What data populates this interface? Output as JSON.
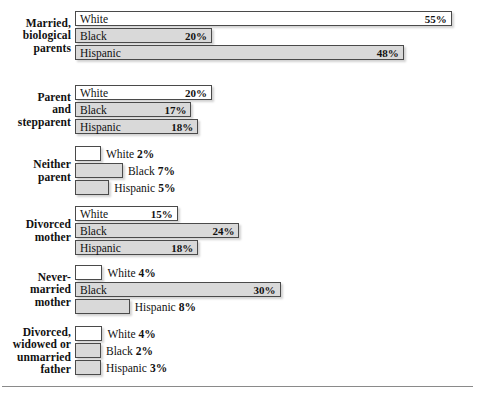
{
  "chart_data": {
    "type": "bar",
    "title": "",
    "subtitle": "",
    "xlabel": "",
    "ylabel": "",
    "orientation": "horizontal",
    "grid": false,
    "legend": "inline-series-labels",
    "value_unit": "%",
    "xlim": [
      0,
      55
    ],
    "series_names": [
      "White",
      "Black",
      "Hispanic"
    ],
    "categories": [
      "Married, biological parents",
      "Parent and stepparent",
      "Neither parent",
      "Divorced mother",
      "Never-married mother",
      "Divorced, widowed or unmarried father"
    ],
    "series": [
      {
        "name": "White",
        "values": [
          55,
          20,
          2,
          15,
          4,
          4
        ]
      },
      {
        "name": "Black",
        "values": [
          20,
          17,
          7,
          24,
          30,
          2
        ]
      },
      {
        "name": "Hispanic",
        "values": [
          48,
          18,
          5,
          18,
          8,
          3
        ]
      }
    ]
  },
  "colors": {
    "white_bar_fill": "#ffffff",
    "shaded_bar_fill": "#d9d9d9",
    "bar_border": "#4a4a4a",
    "text": "#111111",
    "rule": "#8a8a8a",
    "background": "#ffffff"
  },
  "groups": [
    {
      "label": "Married,\nbiological\nparents",
      "label_lines": [
        "Married,",
        "biological",
        "parents"
      ],
      "bars": [
        {
          "series": "White",
          "value_text": "55%",
          "value": 55,
          "fill": "white",
          "label_inside": true
        },
        {
          "series": "Black",
          "value_text": "20%",
          "value": 20,
          "fill": "shade",
          "label_inside": true
        },
        {
          "series": "Hispanic",
          "value_text": "48%",
          "value": 48,
          "fill": "shade",
          "label_inside": true
        }
      ]
    },
    {
      "label": "Parent\nand\nstepparent",
      "label_lines": [
        "Parent",
        "and",
        "stepparent"
      ],
      "bars": [
        {
          "series": "White",
          "value_text": "20%",
          "value": 20,
          "fill": "white",
          "label_inside": true
        },
        {
          "series": "Black",
          "value_text": "17%",
          "value": 17,
          "fill": "shade",
          "label_inside": true
        },
        {
          "series": "Hispanic",
          "value_text": "18%",
          "value": 18,
          "fill": "shade",
          "label_inside": true
        }
      ]
    },
    {
      "label": "Neither\nparent",
      "label_lines": [
        "Neither",
        "parent"
      ],
      "bars": [
        {
          "series": "White",
          "value_text": "2%",
          "value": 2,
          "fill": "white",
          "label_inside": false
        },
        {
          "series": "Black",
          "value_text": "7%",
          "value": 7,
          "fill": "shade",
          "label_inside": false
        },
        {
          "series": "Hispanic",
          "value_text": "5%",
          "value": 5,
          "fill": "shade",
          "label_inside": false
        }
      ]
    },
    {
      "label": "Divorced\nmother",
      "label_lines": [
        "Divorced",
        "mother"
      ],
      "bars": [
        {
          "series": "White",
          "value_text": "15%",
          "value": 15,
          "fill": "white",
          "label_inside": true
        },
        {
          "series": "Black",
          "value_text": "24%",
          "value": 24,
          "fill": "shade",
          "label_inside": true
        },
        {
          "series": "Hispanic",
          "value_text": "18%",
          "value": 18,
          "fill": "shade",
          "label_inside": true
        }
      ]
    },
    {
      "label": "Never-\nmarried\nmother",
      "label_lines": [
        "Never-",
        "married",
        "mother"
      ],
      "bars": [
        {
          "series": "White",
          "value_text": "4%",
          "value": 4,
          "fill": "white",
          "label_inside": false
        },
        {
          "series": "Black",
          "value_text": "30%",
          "value": 30,
          "fill": "shade",
          "label_inside": true
        },
        {
          "series": "Hispanic",
          "value_text": "8%",
          "value": 8,
          "fill": "shade",
          "label_inside": false
        }
      ]
    },
    {
      "label": "Divorced,\nwidowed or\nunmarried\nfather",
      "label_lines": [
        "Divorced,",
        "widowed or",
        "unmarried",
        "father"
      ],
      "bars": [
        {
          "series": "White",
          "value_text": "4%",
          "value": 4,
          "fill": "white",
          "label_inside": false
        },
        {
          "series": "Black",
          "value_text": "2%",
          "value": 2,
          "fill": "shade",
          "label_inside": false
        },
        {
          "series": "Hispanic",
          "value_text": "3%",
          "value": 3,
          "fill": "shade",
          "label_inside": false
        }
      ]
    }
  ]
}
